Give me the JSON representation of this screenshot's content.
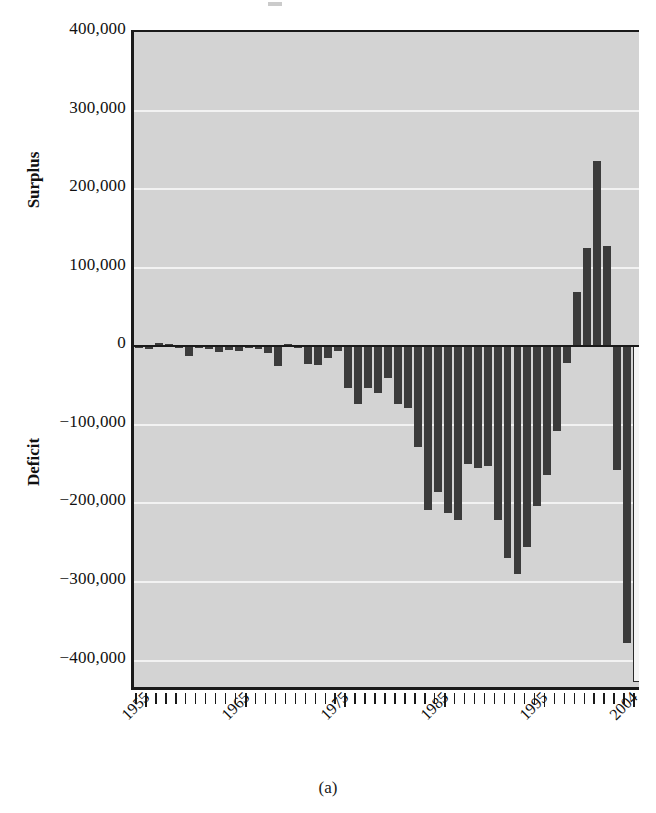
{
  "figure": {
    "caption": "(a)",
    "panel_label": "(a)"
  },
  "axes": {
    "y_labels": [
      "400,000",
      "300,000",
      "200,000",
      "100,000",
      "0",
      "−100,000",
      "−200,000",
      "−300,000",
      "−400,000"
    ],
    "y_values": [
      400000,
      300000,
      200000,
      100000,
      0,
      -100000,
      -200000,
      -300000,
      -400000
    ],
    "surplus_label": "Surplus",
    "deficit_label": "Deficit",
    "x_labels": [
      "1955",
      "1965",
      "1975",
      "1985",
      "1995",
      "2004"
    ],
    "x_label_years": [
      1955,
      1965,
      1975,
      1985,
      1995,
      2004
    ]
  },
  "colors": {
    "plot_background": "#d3d3d3",
    "gridline": "#f2f2f2",
    "bar_fill": "#3b3b3b",
    "bar_projected_fill": "#f5f5f5",
    "bar_projected_stroke": "#2b2b2b",
    "axis": "#1a1a1a",
    "text": "#111111",
    "page_background": "#ffffff"
  },
  "chart_data": {
    "type": "bar",
    "title": "",
    "subtitle": "",
    "xlabel": "",
    "ylabel": "Surplus / Deficit",
    "ylim": [
      -440000,
      400000
    ],
    "xlim": [
      1953.5,
      2004.5
    ],
    "grid": true,
    "gridlines_y": [
      300000,
      200000,
      100000,
      -100000,
      -200000,
      -300000,
      -400000
    ],
    "zero_line": 0,
    "legend": "none",
    "units": "millions of dollars",
    "categories": [
      1954,
      1955,
      1956,
      1957,
      1958,
      1959,
      1960,
      1961,
      1962,
      1963,
      1964,
      1965,
      1966,
      1967,
      1968,
      1969,
      1970,
      1971,
      1972,
      1973,
      1974,
      1975,
      1976,
      1977,
      1978,
      1979,
      1980,
      1981,
      1982,
      1983,
      1984,
      1985,
      1986,
      1987,
      1988,
      1989,
      1990,
      1991,
      1992,
      1993,
      1994,
      1995,
      1996,
      1997,
      1998,
      1999,
      2000,
      2001,
      2002,
      2003,
      2004
    ],
    "values": [
      -1200,
      -3000,
      3900,
      3400,
      -2800,
      -12800,
      300,
      -3300,
      -7100,
      -4800,
      -5900,
      -1400,
      -3700,
      -8600,
      -25200,
      3200,
      -2800,
      -23000,
      -23400,
      -14900,
      -6100,
      -53200,
      -73700,
      -53700,
      -59200,
      -40700,
      -73800,
      -79000,
      -128000,
      -207800,
      -185400,
      -212300,
      -221200,
      -149700,
      -155200,
      -152600,
      -221000,
      -269200,
      -290300,
      -255100,
      -203200,
      -164000,
      -107400,
      -21900,
      69300,
      125600,
      236200,
      128200,
      -157800,
      -377600,
      -427000
    ],
    "last_bar_style": "open-outline (projected estimate)",
    "max_value": 236200,
    "min_value": -427000,
    "max_year": 2000,
    "min_year": 2004
  }
}
